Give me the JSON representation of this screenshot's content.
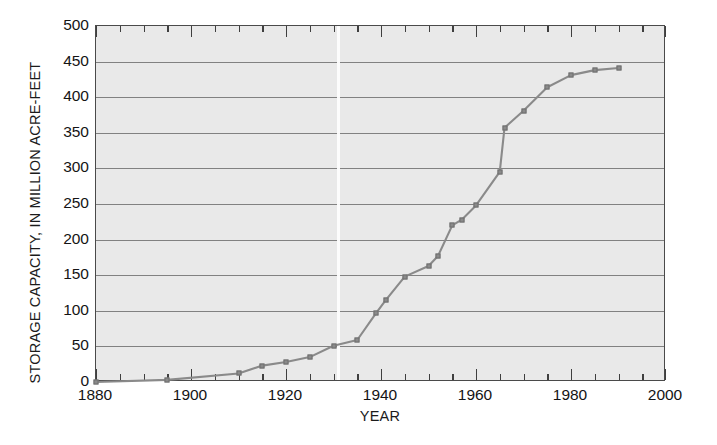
{
  "figure": {
    "background_color": "#ffffff",
    "plot_background_color": "#e9e9e9",
    "series_color": "#8a8a8a",
    "grid_color": "#6f6f6f",
    "axis_color": "#4a4a4a",
    "text_color": "#141414"
  },
  "chart_data": {
    "type": "line",
    "title": "",
    "xlabel": "YEAR",
    "ylabel": "STORAGE CAPACITY, IN MILLION ACRE-FEET",
    "xlim": [
      1880,
      2000
    ],
    "ylim": [
      0,
      500
    ],
    "xticks": [
      1880,
      1900,
      1920,
      1940,
      1960,
      1980,
      2000
    ],
    "xtick_labels": [
      "1880",
      "1900",
      "1920",
      "1940",
      "1960",
      "1980",
      "2000"
    ],
    "xminor_step": 5,
    "yticks": [
      0,
      50,
      100,
      150,
      200,
      250,
      300,
      350,
      400,
      450,
      500
    ],
    "ytick_labels": [
      "0",
      "50",
      "100",
      "150",
      "200",
      "250",
      "300",
      "350",
      "400",
      "450",
      "500"
    ],
    "grid": "horizontal",
    "legend": "none",
    "markers": "square",
    "series": [
      {
        "name": "Storage capacity",
        "x": [
          1880,
          1895,
          1910,
          1915,
          1920,
          1925,
          1930,
          1935,
          1939,
          1941,
          1945,
          1950,
          1952,
          1955,
          1957,
          1960,
          1965,
          1966,
          1970,
          1975,
          1980,
          1985,
          1990
        ],
        "y": [
          0,
          3,
          12,
          23,
          28,
          35,
          51,
          59,
          97,
          115,
          148,
          163,
          177,
          220,
          228,
          248,
          295,
          357,
          381,
          414,
          431,
          438,
          441
        ]
      }
    ]
  }
}
